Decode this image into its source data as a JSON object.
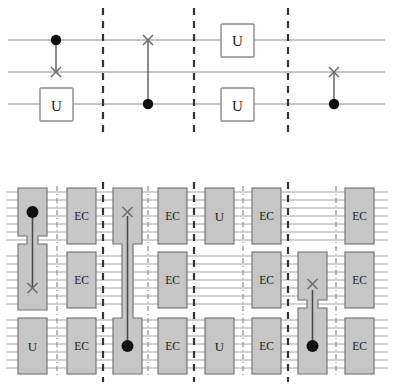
{
  "figure": {
    "colors": {
      "wire": "#8c8c8c",
      "barrier": "#333333",
      "sub_barrier": "#8e8e8e",
      "block_fill": "#c6c6c6",
      "block_stroke": "#6e6e6e",
      "gate_box_fill": "#ffffff",
      "gate_box_stroke": "#8a8a8a",
      "control_dot": "#111111",
      "swap_mark": "#6a6a6a",
      "background": "#ffffff"
    }
  },
  "top_circuit": {
    "name": "logical-circuit",
    "wire_count": 3,
    "wire_labels": [
      "wire-1",
      "wire-2",
      "wire-3"
    ],
    "barriers": 3,
    "columns": [
      {
        "index": 1,
        "gates": [
          {
            "type": "control",
            "wire": 1,
            "symbol": "filled-dot"
          },
          {
            "type": "swap-target",
            "wire": 2,
            "symbol": "X"
          },
          {
            "type": "unitary",
            "wire": 3,
            "label": "U"
          }
        ]
      },
      {
        "index": 2,
        "gates": [
          {
            "type": "swap-target",
            "wire": 1,
            "symbol": "X"
          },
          {
            "type": "control",
            "wire": 3,
            "symbol": "filled-dot"
          }
        ]
      },
      {
        "index": 3,
        "gates": [
          {
            "type": "unitary",
            "wire": 1,
            "label": "U"
          },
          {
            "type": "unitary",
            "wire": 3,
            "label": "U"
          }
        ]
      },
      {
        "index": 4,
        "gates": [
          {
            "type": "swap-target",
            "wire": 2,
            "symbol": "X"
          },
          {
            "type": "control",
            "wire": 3,
            "symbol": "filled-dot"
          }
        ]
      }
    ]
  },
  "bottom_circuit": {
    "name": "encoded-circuit",
    "block_rows": 3,
    "wires_per_row": 7,
    "ec_label": "EC",
    "u_label": "U",
    "swap_symbol": "X",
    "control_symbol": "filled-dot",
    "sections": [
      {
        "index": 1,
        "gate_column": [
          {
            "row": 1,
            "type": "control",
            "label": "",
            "symbol": "filled-dot",
            "tall": true
          },
          {
            "row": 2,
            "type": "swap-target",
            "label": "",
            "symbol": "X",
            "tall": true
          },
          {
            "row": 3,
            "type": "unitary",
            "label": "U"
          }
        ],
        "ec_column": [
          {
            "row": 1,
            "label": "EC"
          },
          {
            "row": 2,
            "label": "EC"
          },
          {
            "row": 3,
            "label": "EC"
          }
        ]
      },
      {
        "index": 2,
        "gate_column": [
          {
            "row": 1,
            "type": "swap-target",
            "label": "",
            "symbol": "X",
            "tall": true
          },
          {
            "row": 2,
            "type": "none",
            "label": ""
          },
          {
            "row": 3,
            "type": "control",
            "label": "",
            "symbol": "filled-dot",
            "tall": true
          }
        ],
        "ec_column": [
          {
            "row": 1,
            "label": "EC"
          },
          {
            "row": 2,
            "label": "EC"
          },
          {
            "row": 3,
            "label": "EC"
          }
        ]
      },
      {
        "index": 3,
        "gate_column": [
          {
            "row": 1,
            "type": "unitary",
            "label": "U"
          },
          {
            "row": 2,
            "type": "none",
            "label": ""
          },
          {
            "row": 3,
            "type": "unitary",
            "label": "U"
          }
        ],
        "ec_column": [
          {
            "row": 1,
            "label": "EC"
          },
          {
            "row": 2,
            "label": "EC"
          },
          {
            "row": 3,
            "label": "EC"
          }
        ]
      },
      {
        "index": 4,
        "gate_column": [
          {
            "row": 1,
            "type": "none",
            "label": ""
          },
          {
            "row": 2,
            "type": "swap-target",
            "label": "",
            "symbol": "X",
            "tall": true
          },
          {
            "row": 3,
            "type": "control",
            "label": "",
            "symbol": "filled-dot",
            "tall": true
          }
        ],
        "ec_column": [
          {
            "row": 1,
            "label": "EC"
          },
          {
            "row": 2,
            "label": "EC"
          },
          {
            "row": 3,
            "label": "EC"
          }
        ]
      }
    ]
  }
}
